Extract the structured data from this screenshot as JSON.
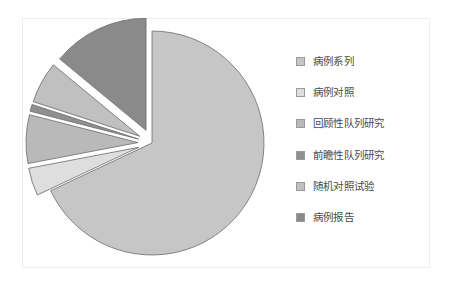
{
  "card": {
    "background_color": "#ffffff",
    "border_color": "#ededed"
  },
  "legend": {
    "position": "right",
    "items": [
      {
        "label": "病例系列",
        "color": "#c6c6c6",
        "swatch_name": "legend-swatch-case-series"
      },
      {
        "label": "病例对照",
        "color": "#dedede",
        "swatch_name": "legend-swatch-case-control"
      },
      {
        "label": "回顾性队列研究",
        "color": "#b9b9b9",
        "swatch_name": "legend-swatch-retrospective-cohort"
      },
      {
        "label": "前瞻性队列研究",
        "color": "#8f8f8f",
        "swatch_name": "legend-swatch-prospective-cohort"
      },
      {
        "label": "随机对照试验",
        "color": "#c0c0c0",
        "swatch_name": "legend-swatch-rct"
      },
      {
        "label": "病例报告",
        "color": "#8a8a8a",
        "swatch_name": "legend-swatch-case-report"
      }
    ]
  },
  "chart_data": {
    "type": "pie",
    "title": "",
    "subtitle": "",
    "xlabel": "",
    "ylabel": "",
    "grid": false,
    "legend_position": "right",
    "start_angle_deg": 0,
    "direction": "clockwise",
    "categories": [
      "病例系列",
      "病例对照",
      "回顾性队列研究",
      "前瞻性队列研究",
      "随机对照试验",
      "病例报告"
    ],
    "values": [
      68,
      4,
      7,
      1,
      6,
      14
    ],
    "unit": "percent",
    "slices": [
      {
        "label": "病例系列",
        "value": 68,
        "color": "#c6c6c6",
        "exploded": false,
        "explode_offset": 0
      },
      {
        "label": "病例对照",
        "value": 4,
        "color": "#dedede",
        "exploded": true,
        "explode_offset": 14
      },
      {
        "label": "回顾性队列研究",
        "value": 7,
        "color": "#b9b9b9",
        "exploded": true,
        "explode_offset": 14
      },
      {
        "label": "前瞻性队列研究",
        "value": 1,
        "color": "#8f8f8f",
        "exploded": true,
        "explode_offset": 14
      },
      {
        "label": "随机对照试验",
        "value": 6,
        "color": "#c0c0c0",
        "exploded": true,
        "explode_offset": 14
      },
      {
        "label": "病例报告",
        "value": 14,
        "color": "#8a8a8a",
        "exploded": true,
        "explode_offset": 14
      }
    ],
    "geometry": {
      "center_x": 132,
      "center_y": 125,
      "radius": 112,
      "stroke_color": "#6b6b6b",
      "stroke_width": 0.8
    }
  }
}
